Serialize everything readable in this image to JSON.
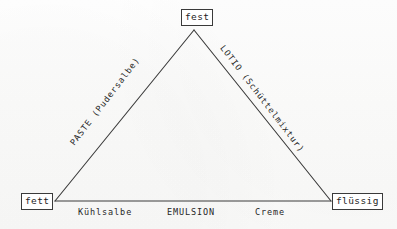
{
  "diagram": {
    "type": "ternary-triangle",
    "vertices": [
      {
        "id": "fest",
        "label": "fest",
        "position": "top"
      },
      {
        "id": "fett",
        "label": "fett",
        "position": "bottom-left"
      },
      {
        "id": "fluessig",
        "label": "flüssig",
        "position": "bottom-right"
      }
    ],
    "edges": [
      {
        "id": "left",
        "from": "fett",
        "to": "fest",
        "label": "PASTE  (Pudersalbe)",
        "orientation": "diagonal-up-right"
      },
      {
        "id": "right",
        "from": "fest",
        "to": "fluessig",
        "label": "LOTIO  (Schüttelmixtur)",
        "orientation": "diagonal-down-right"
      },
      {
        "id": "base",
        "from": "fett",
        "to": "fluessig",
        "label": "EMULSION",
        "orientation": "horizontal"
      }
    ],
    "base_labels": [
      {
        "id": "kuehlsalbe",
        "label": "Kühlsalbe"
      },
      {
        "id": "emulsion",
        "label": "EMULSION"
      },
      {
        "id": "creme",
        "label": "Creme"
      }
    ],
    "colors": {
      "paper": "#fbfbfa",
      "ink": "#262626",
      "stroke": "#3a3a3a",
      "box_fill": "#ffffff"
    },
    "geometry": {
      "apex": {
        "x": 194,
        "y": 30
      },
      "bottom_left": {
        "x": 55,
        "y": 201
      },
      "bottom_right": {
        "x": 331,
        "y": 201
      }
    }
  }
}
